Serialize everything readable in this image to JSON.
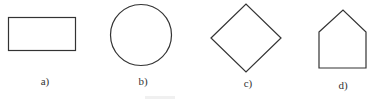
{
  "figure": {
    "shapes": [
      {
        "name": "rectangle",
        "label": "a)"
      },
      {
        "name": "circle",
        "label": "b)"
      },
      {
        "name": "square-rotated",
        "label": "c)"
      },
      {
        "name": "pentagon",
        "label": "d)"
      }
    ],
    "stroke_color": "#333333"
  }
}
